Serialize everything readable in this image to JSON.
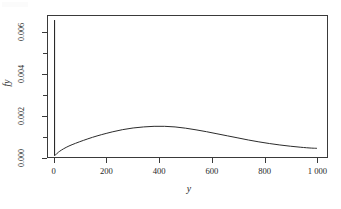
{
  "chart_data": {
    "type": "line",
    "title": "",
    "subtitle": "",
    "xlabel": "y",
    "ylabel": "fy",
    "grid": false,
    "legend": null,
    "xlim": [
      -25,
      1040
    ],
    "ylim": [
      0.0,
      0.0068
    ],
    "x_ticks": [
      {
        "value": 0,
        "label": "0"
      },
      {
        "value": 200,
        "label": "200"
      },
      {
        "value": 400,
        "label": "400"
      },
      {
        "value": 600,
        "label": "600"
      },
      {
        "value": 800,
        "label": "800"
      },
      {
        "value": 1000,
        "label": "1 000"
      }
    ],
    "y_ticks_major": [
      {
        "value": 0.0,
        "label": "0.000"
      },
      {
        "value": 0.002,
        "label": "0.002"
      },
      {
        "value": 0.004,
        "label": "0.004"
      },
      {
        "value": 0.006,
        "label": "0.006"
      }
    ],
    "y_ticks_minor": [
      0.001,
      0.003,
      0.005
    ],
    "series": [
      {
        "name": "fy",
        "comment": "mixture density: point-mass-like spike at y=0 plus broad hump peaking near y=400",
        "x": [
          0,
          0,
          0,
          4,
          10,
          20,
          35,
          55,
          80,
          110,
          145,
          180,
          220,
          260,
          300,
          340,
          380,
          420,
          460,
          500,
          540,
          580,
          620,
          660,
          700,
          740,
          780,
          820,
          860,
          900,
          940,
          980,
          1000
        ],
        "values": [
          8e-05,
          0.0066,
          8e-05,
          0.0001,
          0.00018,
          0.00028,
          0.0004,
          0.00053,
          0.00066,
          0.0008,
          0.00095,
          0.00108,
          0.00121,
          0.00132,
          0.0014,
          0.00145,
          0.00148,
          0.00148,
          0.00145,
          0.00139,
          0.00131,
          0.00122,
          0.00112,
          0.00102,
          0.00092,
          0.00082,
          0.00073,
          0.00065,
          0.00058,
          0.00052,
          0.00047,
          0.00043,
          0.00042
        ]
      }
    ],
    "annotations": [],
    "spike": {
      "x": 0,
      "peak_value": 0.0066,
      "base_value": 8e-05
    },
    "peak": {
      "x": 400,
      "value": 0.00148
    },
    "colors": {
      "line": "#2b2b2b",
      "axis": "#3a3a3a",
      "background": "#ffffff"
    }
  }
}
